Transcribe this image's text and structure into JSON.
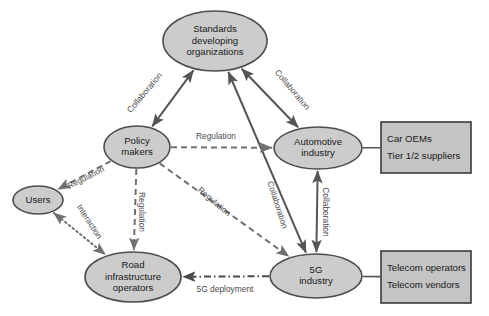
{
  "diagram": {
    "colors": {
      "node_fill": "#cccccc",
      "node_stroke": "#4d4d4d",
      "box_fill": "#c4c4c4",
      "box_stroke": "#3a3a3a",
      "solid_edge": "#555555",
      "dashed_edge": "#707070",
      "label_text": "#4a4a4a"
    },
    "nodes": [
      {
        "id": "sdo",
        "shape": "ellipse",
        "cx": 215,
        "cy": 41,
        "rx": 52,
        "ry": 30,
        "lines": [
          "Standards",
          "developing",
          "organizations"
        ]
      },
      {
        "id": "policy",
        "shape": "ellipse",
        "cx": 137,
        "cy": 147,
        "rx": 33,
        "ry": 21,
        "lines": [
          "Policy",
          "makers"
        ]
      },
      {
        "id": "automotive",
        "shape": "ellipse",
        "cx": 318,
        "cy": 148,
        "rx": 44,
        "ry": 21,
        "lines": [
          "Automotive",
          "industry"
        ]
      },
      {
        "id": "users",
        "shape": "ellipse",
        "cx": 38,
        "cy": 200,
        "rx": 25,
        "ry": 14,
        "lines": [
          "Users"
        ]
      },
      {
        "id": "road",
        "shape": "ellipse",
        "cx": 133,
        "cy": 277,
        "rx": 48,
        "ry": 25,
        "lines": [
          "Road",
          "infrastructure",
          "operators"
        ]
      },
      {
        "id": "fiveg",
        "shape": "ellipse",
        "cx": 316,
        "cy": 276,
        "rx": 46,
        "ry": 22,
        "lines": [
          "5G",
          "industry"
        ]
      },
      {
        "id": "car_box",
        "shape": "rect",
        "x": 381,
        "y": 122,
        "w": 90,
        "h": 51,
        "lines": [
          "Car OEMs",
          "Tier 1/2 suppliers"
        ]
      },
      {
        "id": "telecom_box",
        "shape": "rect",
        "x": 381,
        "y": 251,
        "w": 90,
        "h": 52,
        "lines": [
          "Telecom operators",
          "Telecom vendors"
        ]
      }
    ],
    "edges": [
      {
        "id": "policy-sdo",
        "from": "policy",
        "to": "sdo",
        "style": "solid",
        "arrows": "both",
        "label": "Collaboration",
        "label_x": 145,
        "label_y": 93,
        "label_rotate": -50
      },
      {
        "id": "sdo-automotive",
        "from": "sdo",
        "to": "automotive",
        "style": "solid",
        "arrows": "both",
        "label": "Collaboration",
        "label_x": 292,
        "label_y": 90,
        "label_rotate": 50
      },
      {
        "id": "sdo-fiveg",
        "from": "sdo",
        "to": "fiveg",
        "style": "solid",
        "arrows": "both",
        "label": "Collaboration",
        "label_x": 277,
        "label_y": 205,
        "label_rotate": 72
      },
      {
        "id": "automotive-fiveg",
        "from": "automotive",
        "to": "fiveg",
        "style": "solid",
        "arrows": "both",
        "label": "Collaboration",
        "label_x": 325,
        "label_y": 212,
        "label_rotate": 90
      },
      {
        "id": "policy-automotive",
        "from": "policy",
        "to": "automotive",
        "style": "dashed",
        "arrows": "end",
        "label": "Regulation",
        "label_x": 216,
        "label_y": 137,
        "label_rotate": 0
      },
      {
        "id": "policy-users",
        "from": "policy",
        "to": "users",
        "style": "dashed",
        "arrows": "end",
        "label": "Regulation",
        "label_x": 86,
        "label_y": 178,
        "label_rotate": -27
      },
      {
        "id": "policy-road",
        "from": "policy",
        "to": "road",
        "style": "dashed",
        "arrows": "end",
        "label": "Regulation",
        "label_x": 141,
        "label_y": 212,
        "label_rotate": 90
      },
      {
        "id": "policy-fiveg",
        "from": "policy",
        "to": "fiveg",
        "style": "dashed",
        "arrows": "end",
        "label": "Regulation",
        "label_x": 214,
        "label_y": 202,
        "label_rotate": 40
      },
      {
        "id": "users-road",
        "from": "users",
        "to": "road",
        "style": "dotted",
        "arrows": "both",
        "label": "Interaction",
        "label_x": 89,
        "label_y": 222,
        "label_rotate": 57
      },
      {
        "id": "fiveg-road",
        "from": "fiveg",
        "to": "road",
        "style": "dashdot",
        "arrows": "end",
        "label": "5G deployment",
        "label_x": 225,
        "label_y": 290,
        "label_rotate": 0
      },
      {
        "id": "automotive-car_box",
        "from": "automotive",
        "to": "car_box",
        "style": "plain",
        "arrows": "none",
        "label": "",
        "label_x": 0,
        "label_y": 0,
        "label_rotate": 0
      },
      {
        "id": "fiveg-telecom_box",
        "from": "fiveg",
        "to": "telecom_box",
        "style": "plain",
        "arrows": "none",
        "label": "",
        "label_x": 0,
        "label_y": 0,
        "label_rotate": 0
      }
    ]
  }
}
